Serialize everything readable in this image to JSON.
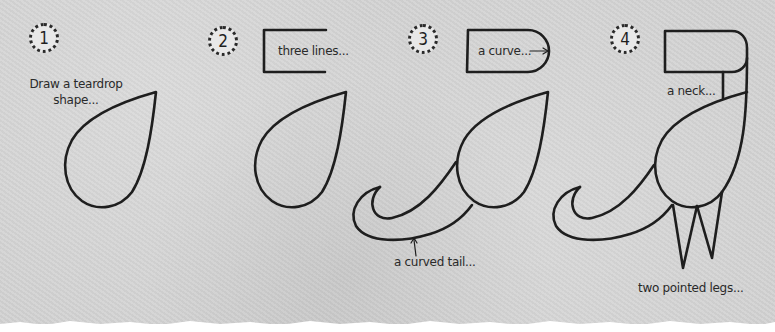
{
  "steps": [
    {
      "number": "1",
      "instruction": "Draw a teardrop",
      "instruction_line2": "shape..."
    },
    {
      "number": "2",
      "annotation": "three lines..."
    },
    {
      "number": "3",
      "annotation_head": "a curve...",
      "annotation_tail": "a curved tail..."
    },
    {
      "number": "4",
      "annotation_neck": "a neck...",
      "annotation_legs": "two pointed legs..."
    }
  ],
  "colors": {
    "background": "#d3d3d3",
    "ink": "#1e1e1e",
    "paper_edge": "#ffffff"
  },
  "icons": {
    "step_badge": "dotted-circle-icon",
    "arrow": "arrow-icon"
  }
}
